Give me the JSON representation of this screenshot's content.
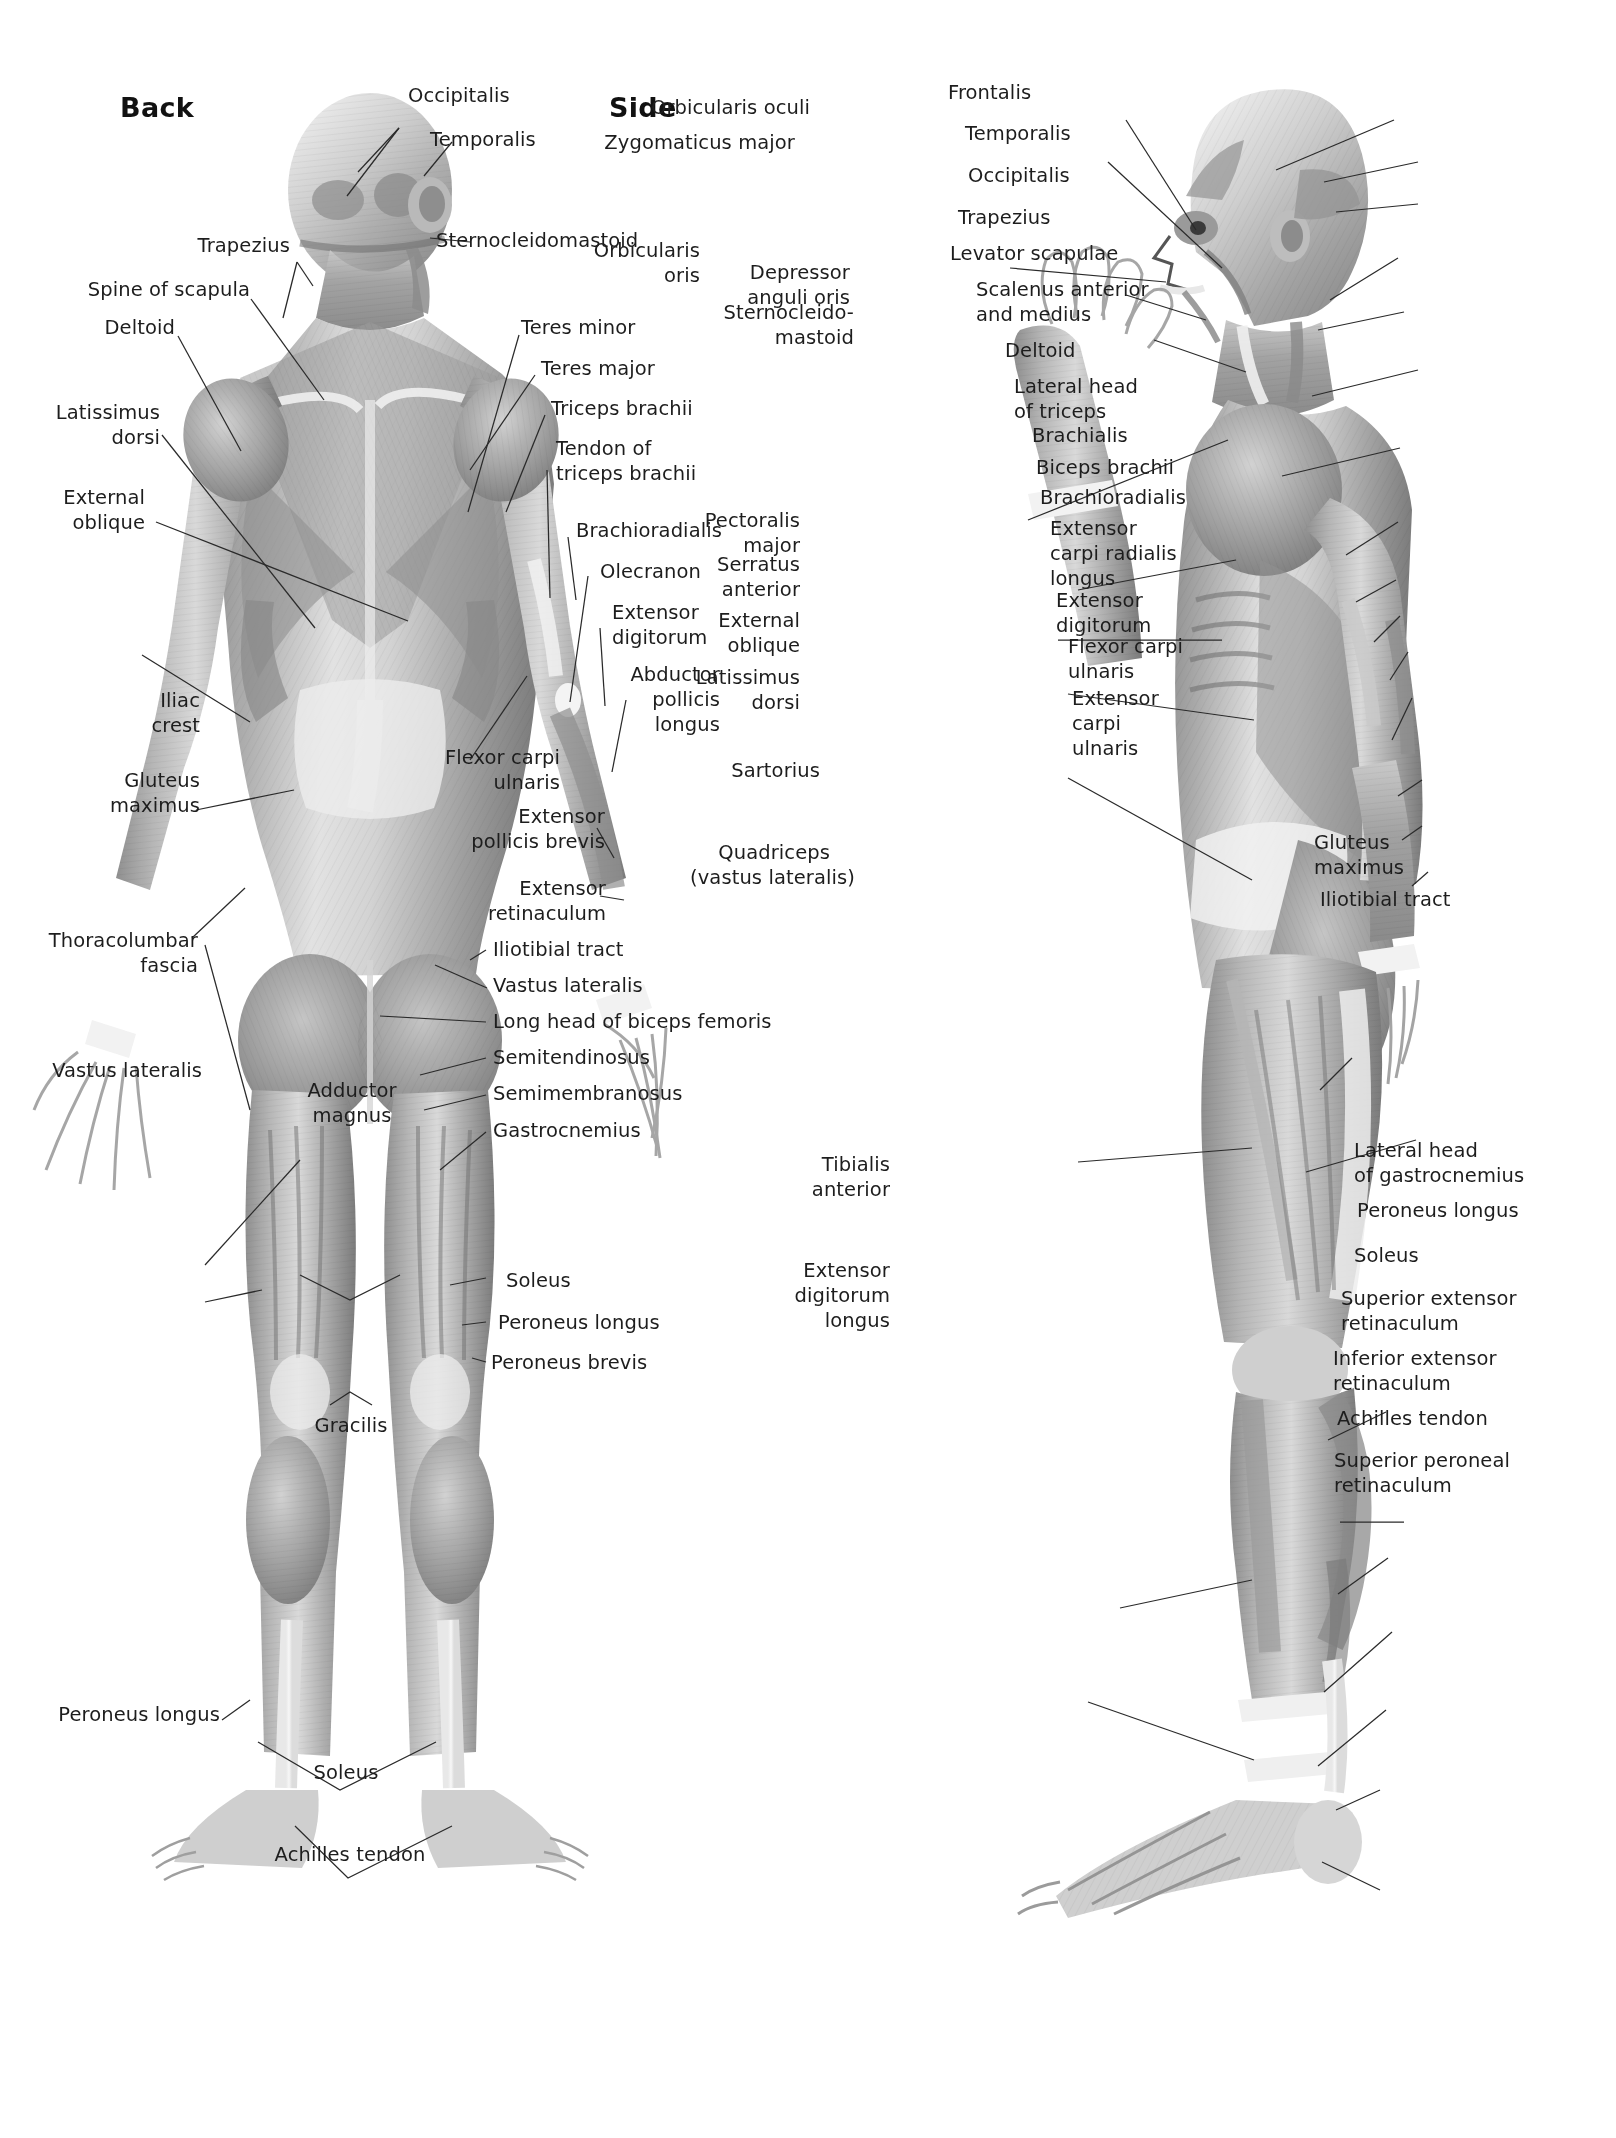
{
  "plate": {
    "background": "#ffffff",
    "ink": "#1d1d1d",
    "muscle_mid": "#9a9a9a",
    "muscle_dark": "#6d6d6d",
    "muscle_light": "#d8d8d8"
  },
  "figures": [
    {
      "id": "back",
      "title": "Back"
    },
    {
      "id": "side",
      "title": "Side"
    }
  ],
  "labels": {
    "back": {
      "left": [
        {
          "text": "Trapezius"
        },
        {
          "text": "Spine of scapula"
        },
        {
          "text": "Deltoid"
        },
        {
          "text": "Latissimus\ndorsi"
        },
        {
          "text": "External\noblique"
        },
        {
          "text": "Iliac\ncrest"
        },
        {
          "text": "Gluteus\nmaximus"
        },
        {
          "text": "Thoracolumbar\nfascia"
        },
        {
          "text": "Vastus lateralis"
        },
        {
          "text": "Adductor\nmagnus"
        },
        {
          "text": "Gracilis"
        },
        {
          "text": "Peroneus longus"
        },
        {
          "text": "Soleus"
        },
        {
          "text": "Achilles tendon"
        }
      ],
      "right": [
        {
          "text": "Occipitalis"
        },
        {
          "text": "Temporalis"
        },
        {
          "text": "Sternocleidomastoid"
        },
        {
          "text": "Teres minor"
        },
        {
          "text": "Teres major"
        },
        {
          "text": "Triceps brachii"
        },
        {
          "text": "Tendon of\ntriceps brachii"
        },
        {
          "text": "Brachioradialis"
        },
        {
          "text": "Olecranon"
        },
        {
          "text": "Extensor\ndigitorum"
        },
        {
          "text": "Abductor\npollicis\nlongus"
        },
        {
          "text": "Flexor carpi\nulnaris"
        },
        {
          "text": "Extensor\npollicis brevis"
        },
        {
          "text": "Extensor\nretinaculum"
        },
        {
          "text": "Iliotibial tract"
        },
        {
          "text": "Vastus lateralis"
        },
        {
          "text": "Long head of biceps femoris"
        },
        {
          "text": "Semitendinosus"
        },
        {
          "text": "Semimembranosus"
        },
        {
          "text": "Gastrocnemius"
        },
        {
          "text": "Soleus"
        },
        {
          "text": "Peroneus longus"
        },
        {
          "text": "Peroneus brevis"
        }
      ]
    },
    "side": {
      "left": [
        {
          "text": "Orbicularis oculi"
        },
        {
          "text": "Zygomaticus major"
        },
        {
          "text": "Orbicularis\noris"
        },
        {
          "text": "Depressor\nanguli oris"
        },
        {
          "text": "Sternocleido-\nmastoid"
        },
        {
          "text": "Pectoralis\nmajor"
        },
        {
          "text": "Serratus\nanterior"
        },
        {
          "text": "External\noblique"
        },
        {
          "text": "Latissimus\ndorsi"
        },
        {
          "text": "Sartorius"
        },
        {
          "text": "Quadriceps\n(vastus lateralis)"
        },
        {
          "text": "Tibialis\nanterior"
        },
        {
          "text": "Extensor\ndigitorum\nlongus"
        }
      ],
      "right": [
        {
          "text": "Frontalis"
        },
        {
          "text": "Temporalis"
        },
        {
          "text": "Occipitalis"
        },
        {
          "text": "Trapezius"
        },
        {
          "text": "Levator scapulae"
        },
        {
          "text": "Scalenus anterior\nand medius"
        },
        {
          "text": "Deltoid"
        },
        {
          "text": "Lateral head\nof triceps"
        },
        {
          "text": "Brachialis"
        },
        {
          "text": "Biceps brachii"
        },
        {
          "text": "Brachioradialis"
        },
        {
          "text": "Extensor\ncarpi radialis\nlongus"
        },
        {
          "text": "Extensor\ndigitorum"
        },
        {
          "text": "Flexor carpi\nulnaris"
        },
        {
          "text": "Extensor\ncarpi\nulnaris"
        },
        {
          "text": "Gluteus\nmaximus"
        },
        {
          "text": "Iliotibial tract"
        },
        {
          "text": "Lateral head\nof gastrocnemius"
        },
        {
          "text": "Peroneus longus"
        },
        {
          "text": "Soleus"
        },
        {
          "text": "Superior extensor\nretinaculum"
        },
        {
          "text": "Inferior extensor\nretinaculum"
        },
        {
          "text": "Achilles tendon"
        },
        {
          "text": "Superior peroneal\nretinaculum"
        }
      ]
    }
  }
}
